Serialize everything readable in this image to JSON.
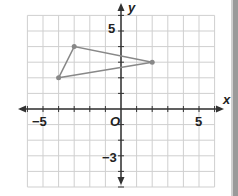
{
  "chart_data": {
    "type": "scatter",
    "title": "",
    "xlabel": "x",
    "ylabel": "y",
    "origin_label": "O",
    "xlim": [
      -6,
      6
    ],
    "ylim": [
      -5,
      6
    ],
    "grid": true,
    "x_tick_labels": [
      "-5",
      "5"
    ],
    "y_tick_labels": [
      "5",
      "-3"
    ],
    "polygon": {
      "shape": "triangle",
      "vertices": [
        [
          -4,
          2
        ],
        [
          -3,
          4
        ],
        [
          2,
          3
        ]
      ],
      "color": "#888888"
    }
  },
  "labels": {
    "x_axis": "x",
    "y_axis": "y",
    "origin": "O",
    "x_neg5": "−5",
    "x_pos5": "5",
    "y_pos5": "5",
    "y_neg3": "−3"
  }
}
